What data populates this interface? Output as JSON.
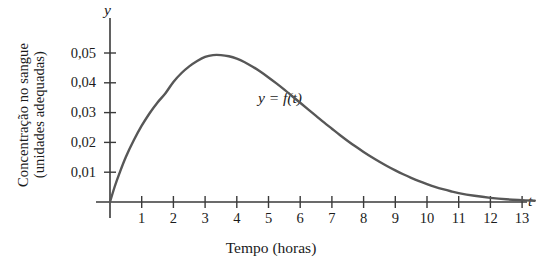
{
  "chart_data": {
    "type": "line",
    "title": "",
    "subtitle": "",
    "xlabel": "Tempo (horas)",
    "ylabel": "Concentração no sangue (unidades adequadas)",
    "ylabel_lines": [
      "Concentração no sangue",
      "(unidades adequadas)"
    ],
    "x_axis_symbol": "t",
    "y_axis_symbol": "y",
    "xlim": [
      0,
      13.6
    ],
    "ylim": [
      0,
      0.056
    ],
    "xticks": [
      1,
      2,
      3,
      4,
      5,
      6,
      7,
      8,
      9,
      10,
      11,
      12,
      13
    ],
    "xtick_labels": [
      "1",
      "2",
      "3",
      "4",
      "5",
      "6",
      "7",
      "8",
      "9",
      "10",
      "11",
      "12",
      "13"
    ],
    "yticks": [
      0.01,
      0.02,
      0.03,
      0.04,
      0.05
    ],
    "ytick_labels": [
      "0,01",
      "0,02",
      "0,03",
      "0,04",
      "0,05"
    ],
    "grid": false,
    "legend": null,
    "annotations": [
      {
        "text": "y = f(t)",
        "x": 6.4,
        "y": 0.0345
      }
    ],
    "series": [
      {
        "name": "f(t)",
        "color": "#575757",
        "linewidth": 2.4,
        "x": [
          0,
          0.15,
          0.3,
          0.5,
          0.75,
          1,
          1.25,
          1.5,
          1.75,
          2,
          2.25,
          2.5,
          2.75,
          3,
          3.25,
          3.5,
          3.75,
          4,
          4.25,
          4.5,
          4.75,
          5,
          5.25,
          5.5,
          5.75,
          6,
          6.25,
          6.5,
          6.75,
          7,
          7.25,
          7.5,
          7.75,
          8,
          8.25,
          8.5,
          8.75,
          9,
          9.25,
          9.5,
          9.75,
          10,
          10.25,
          10.5,
          10.75,
          11,
          11.5,
          12,
          12.5,
          13,
          13.4
        ],
        "y": [
          0,
          0.0052,
          0.0097,
          0.0151,
          0.0207,
          0.0256,
          0.0298,
          0.0334,
          0.0365,
          0.0403,
          0.0432,
          0.0455,
          0.0473,
          0.0487,
          0.0493,
          0.0493,
          0.0489,
          0.0481,
          0.0469,
          0.0454,
          0.0437,
          0.0418,
          0.0398,
          0.0377,
          0.0355,
          0.0333,
          0.0311,
          0.0289,
          0.0267,
          0.0246,
          0.0225,
          0.0205,
          0.0186,
          0.0168,
          0.0151,
          0.0135,
          0.012,
          0.0106,
          0.0093,
          0.0081,
          0.007,
          0.006,
          0.0051,
          0.0043,
          0.0036,
          0.003,
          0.0021,
          0.0014,
          0.0009,
          0.0006,
          0.0004
        ],
        "peak": {
          "x": 3.35,
          "y": 0.0493
        }
      }
    ],
    "colors": {
      "curve": "#575757",
      "axis": "#3a3a3a",
      "text": "#1b1b1b",
      "background": "#ffffff"
    }
  }
}
